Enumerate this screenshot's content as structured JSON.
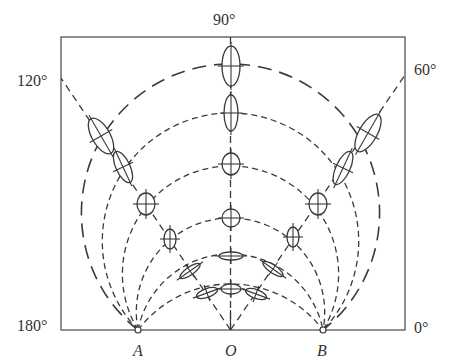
{
  "figure": {
    "angle_labels": {
      "top": "90°",
      "upper_left": "120°",
      "upper_right": "60°",
      "bottom_left": "180°",
      "bottom_right": "0°"
    },
    "point_labels": {
      "a": "A",
      "o": "O",
      "b": "B"
    },
    "colors": {
      "line": "#3a3a3a",
      "frame": "#555555",
      "background": "#ffffff"
    },
    "points": {
      "A": [
        138,
        330
      ],
      "O": [
        230.5,
        330
      ],
      "B": [
        323,
        330
      ]
    },
    "arches": [
      {
        "cx": 230.5,
        "cy": 400.0,
        "r": 116.0,
        "dash": "6 4"
      },
      {
        "cx": 230.5,
        "cy": 348.3,
        "r": 94.3,
        "dash": "6 4"
      },
      {
        "cx": 230.5,
        "cy": 312.2,
        "r": 94.2,
        "dash": "6 4"
      },
      {
        "cx": 230.5,
        "cy": 274.1,
        "r": 108.1,
        "dash": "6 4"
      },
      {
        "cx": 230.5,
        "cy": 241.2,
        "r": 128.2,
        "dash": "6 4"
      },
      {
        "cx": 230.5,
        "cy": 213.1,
        "r": 149.1,
        "dash": "14 8"
      }
    ],
    "radials": [
      {
        "angle_deg": 90,
        "to": [
          230.5,
          37
        ]
      },
      {
        "angle_deg": 120,
        "to": [
          61,
          78
        ]
      },
      {
        "angle_deg": 60,
        "to": [
          405,
          75
        ]
      }
    ],
    "ellipses": [
      {
        "cx": 231,
        "cy": 66,
        "rx": 9,
        "ry": 20,
        "rot": 0
      },
      {
        "cx": 231,
        "cy": 113,
        "rx": 7,
        "ry": 18,
        "rot": 0
      },
      {
        "cx": 231,
        "cy": 164,
        "rx": 9,
        "ry": 11,
        "rot": 0
      },
      {
        "cx": 231,
        "cy": 218,
        "rx": 9,
        "ry": 9,
        "rot": 0
      },
      {
        "cx": 231,
        "cy": 256,
        "rx": 12,
        "ry": 4,
        "rot": 0
      },
      {
        "cx": 231,
        "cy": 289,
        "rx": 10,
        "ry": 5,
        "rot": 0
      },
      {
        "cx": 101,
        "cy": 136,
        "rx": 9,
        "ry": 20,
        "rot": -30
      },
      {
        "cx": 123,
        "cy": 167,
        "rx": 7,
        "ry": 17,
        "rot": -25
      },
      {
        "cx": 146,
        "cy": 204,
        "rx": 9,
        "ry": 11,
        "rot": 0
      },
      {
        "cx": 170,
        "cy": 239,
        "rx": 6,
        "ry": 10,
        "rot": 0
      },
      {
        "cx": 190,
        "cy": 271,
        "rx": 12,
        "ry": 4,
        "rot": -35
      },
      {
        "cx": 207,
        "cy": 293,
        "rx": 11,
        "ry": 4.5,
        "rot": -20
      },
      {
        "cx": 368,
        "cy": 133,
        "rx": 9,
        "ry": 21,
        "rot": 30
      },
      {
        "cx": 343,
        "cy": 168,
        "rx": 7,
        "ry": 18,
        "rot": 25
      },
      {
        "cx": 318,
        "cy": 204,
        "rx": 9,
        "ry": 11,
        "rot": 0
      },
      {
        "cx": 293,
        "cy": 237,
        "rx": 6,
        "ry": 10,
        "rot": 0
      },
      {
        "cx": 273,
        "cy": 269,
        "rx": 12,
        "ry": 4,
        "rot": 35
      },
      {
        "cx": 256,
        "cy": 294,
        "rx": 11,
        "ry": 4.5,
        "rot": 20
      }
    ]
  }
}
